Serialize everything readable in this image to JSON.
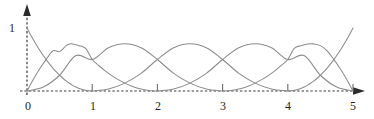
{
  "figure": {
    "background_color": "#ffffff",
    "curve_color": "#8c8c8c",
    "axis_color": "#3b3b3b",
    "text_color": "#231f20"
  },
  "axes": {
    "x_axis": {
      "name": "x-axis",
      "style": "dashed",
      "arrow": "right",
      "tick_labels": [
        "0",
        "1",
        "2",
        "3",
        "4",
        "5"
      ],
      "tick_values": [
        0,
        1,
        2,
        3,
        4,
        5
      ],
      "tick_marks_at": [
        1,
        2,
        3,
        4,
        5
      ],
      "range": [
        0,
        5
      ]
    },
    "y_axis": {
      "name": "y-axis",
      "style": "dashed",
      "arrow": "up",
      "tick_labels": [
        "1"
      ],
      "tick_values": [
        1
      ],
      "range": [
        0,
        1.15
      ]
    }
  },
  "chart_data": {
    "type": "line",
    "title": "",
    "subtitle": "",
    "xlabel": "",
    "ylabel": "",
    "xlim": [
      0,
      5
    ],
    "ylim": [
      0,
      1.15
    ],
    "grid": false,
    "legend": null,
    "x_ticks": [
      0,
      1,
      2,
      3,
      4,
      5
    ],
    "x_tick_labels": [
      "0",
      "1",
      "2",
      "3",
      "4",
      "5"
    ],
    "y_ticks": [
      1
    ],
    "y_tick_labels": [
      "1"
    ],
    "series": [
      {
        "name": "N0",
        "color": "#8c8c8c",
        "support": [
          0,
          1
        ],
        "peak_x": 0,
        "peak_y": 1,
        "points": [
          [
            0.0,
            1.0
          ],
          [
            0.05,
            0.9025
          ],
          [
            0.1,
            0.81
          ],
          [
            0.15,
            0.7225
          ],
          [
            0.2,
            0.64
          ],
          [
            0.25,
            0.5625
          ],
          [
            0.3,
            0.49
          ],
          [
            0.35,
            0.4225
          ],
          [
            0.4,
            0.36
          ],
          [
            0.45,
            0.3025
          ],
          [
            0.5,
            0.25
          ],
          [
            0.55,
            0.2025
          ],
          [
            0.6,
            0.16
          ],
          [
            0.65,
            0.1225
          ],
          [
            0.7,
            0.09
          ],
          [
            0.75,
            0.0625
          ],
          [
            0.8,
            0.04
          ],
          [
            0.85,
            0.0225
          ],
          [
            0.9,
            0.01
          ],
          [
            0.95,
            0.0025
          ],
          [
            1.0,
            0.0
          ]
        ]
      },
      {
        "name": "N1",
        "color": "#8c8c8c",
        "support": [
          0,
          2
        ],
        "peak_x": 0.667,
        "peak_y": 0.75,
        "points": [
          [
            0.0,
            0.0
          ],
          [
            0.1,
            0.19
          ],
          [
            0.2,
            0.36
          ],
          [
            0.3,
            0.51
          ],
          [
            0.4,
            0.64
          ],
          [
            0.5,
            0.625
          ],
          [
            0.6,
            0.72
          ],
          [
            0.667,
            0.75
          ],
          [
            0.7,
            0.745
          ],
          [
            0.8,
            0.72
          ],
          [
            0.9,
            0.675
          ],
          [
            1.0,
            0.5
          ],
          [
            1.1,
            0.405
          ],
          [
            1.2,
            0.32
          ],
          [
            1.3,
            0.245
          ],
          [
            1.4,
            0.18
          ],
          [
            1.5,
            0.125
          ],
          [
            1.6,
            0.08
          ],
          [
            1.7,
            0.045
          ],
          [
            1.8,
            0.02
          ],
          [
            1.9,
            0.005
          ],
          [
            2.0,
            0.0
          ]
        ]
      },
      {
        "name": "N2",
        "color": "#8c8c8c",
        "support": [
          0,
          3
        ],
        "peak_x": 1.5,
        "peak_y": 0.75,
        "points": [
          [
            0.0,
            0.0
          ],
          [
            0.25,
            0.0625
          ],
          [
            0.5,
            0.25
          ],
          [
            0.75,
            0.5625
          ],
          [
            1.0,
            0.5
          ],
          [
            1.25,
            0.6875
          ],
          [
            1.5,
            0.75
          ],
          [
            1.75,
            0.6875
          ],
          [
            2.0,
            0.5
          ],
          [
            2.25,
            0.28
          ],
          [
            2.5,
            0.125
          ],
          [
            2.75,
            0.03
          ],
          [
            3.0,
            0.0
          ]
        ]
      },
      {
        "name": "N3",
        "color": "#8c8c8c",
        "support": [
          1,
          4
        ],
        "peak_x": 2.5,
        "peak_y": 0.75,
        "points": [
          [
            1.0,
            0.0
          ],
          [
            1.25,
            0.03
          ],
          [
            1.5,
            0.125
          ],
          [
            1.75,
            0.28
          ],
          [
            2.0,
            0.5
          ],
          [
            2.25,
            0.6875
          ],
          [
            2.5,
            0.75
          ],
          [
            2.75,
            0.6875
          ],
          [
            3.0,
            0.5
          ],
          [
            3.25,
            0.28
          ],
          [
            3.5,
            0.125
          ],
          [
            3.75,
            0.03
          ],
          [
            4.0,
            0.0
          ]
        ]
      },
      {
        "name": "N4",
        "color": "#8c8c8c",
        "support": [
          2,
          5
        ],
        "peak_x": 3.5,
        "peak_y": 0.75,
        "points": [
          [
            2.0,
            0.0
          ],
          [
            2.25,
            0.03
          ],
          [
            2.5,
            0.125
          ],
          [
            2.75,
            0.28
          ],
          [
            3.0,
            0.5
          ],
          [
            3.25,
            0.6875
          ],
          [
            3.5,
            0.75
          ],
          [
            3.75,
            0.6875
          ],
          [
            4.0,
            0.5
          ],
          [
            4.25,
            0.5625
          ],
          [
            4.5,
            0.25
          ],
          [
            4.75,
            0.0625
          ],
          [
            5.0,
            0.0
          ]
        ]
      },
      {
        "name": "N5",
        "color": "#8c8c8c",
        "support": [
          3,
          5
        ],
        "peak_x": 4.333,
        "peak_y": 0.75,
        "points": [
          [
            3.0,
            0.0
          ],
          [
            3.1,
            0.005
          ],
          [
            3.2,
            0.02
          ],
          [
            3.3,
            0.045
          ],
          [
            3.4,
            0.08
          ],
          [
            3.5,
            0.125
          ],
          [
            3.6,
            0.18
          ],
          [
            3.7,
            0.245
          ],
          [
            3.8,
            0.32
          ],
          [
            3.9,
            0.405
          ],
          [
            4.0,
            0.5
          ],
          [
            4.1,
            0.675
          ],
          [
            4.2,
            0.72
          ],
          [
            4.333,
            0.75
          ],
          [
            4.4,
            0.745
          ],
          [
            4.5,
            0.72
          ],
          [
            4.6,
            0.64
          ],
          [
            4.7,
            0.51
          ],
          [
            4.8,
            0.36
          ],
          [
            4.9,
            0.19
          ],
          [
            5.0,
            0.0
          ]
        ]
      },
      {
        "name": "N6",
        "color": "#8c8c8c",
        "support": [
          4,
          5
        ],
        "peak_x": 5,
        "peak_y": 1,
        "points": [
          [
            4.0,
            0.0
          ],
          [
            4.05,
            0.0025
          ],
          [
            4.1,
            0.01
          ],
          [
            4.15,
            0.0225
          ],
          [
            4.2,
            0.04
          ],
          [
            4.25,
            0.0625
          ],
          [
            4.3,
            0.09
          ],
          [
            4.35,
            0.1225
          ],
          [
            4.4,
            0.16
          ],
          [
            4.45,
            0.2025
          ],
          [
            4.5,
            0.25
          ],
          [
            4.55,
            0.3025
          ],
          [
            4.6,
            0.36
          ],
          [
            4.65,
            0.4225
          ],
          [
            4.7,
            0.49
          ],
          [
            4.75,
            0.5625
          ],
          [
            4.8,
            0.64
          ],
          [
            4.85,
            0.7225
          ],
          [
            4.9,
            0.81
          ],
          [
            4.95,
            0.9025
          ],
          [
            5.0,
            1.0
          ]
        ]
      }
    ]
  }
}
